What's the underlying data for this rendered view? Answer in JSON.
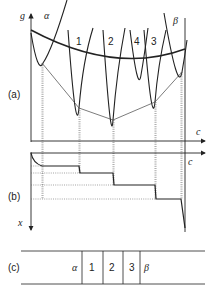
{
  "figure": {
    "panel_a": {
      "label": "(a)",
      "y_axis_label": "g",
      "x_axis_label": "c",
      "phase_labels": [
        "α",
        "1",
        "2",
        "4",
        "3",
        "β"
      ]
    },
    "panel_b": {
      "label": "(b)",
      "x_axis_label": "c",
      "y_axis_label": "x"
    },
    "panel_c": {
      "label": "(c)",
      "layers": [
        "α",
        "1",
        "2",
        "3",
        "β"
      ]
    }
  }
}
